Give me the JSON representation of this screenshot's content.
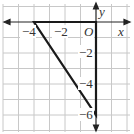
{
  "diagram": {
    "type": "coordinate-plane-triangle",
    "origin_label": "O",
    "x_axis_label": "x",
    "y_axis_label": "y",
    "x_tick_labels": [
      "−4",
      "−2"
    ],
    "y_tick_labels": [
      "−2",
      "−4",
      "−6"
    ],
    "grid": {
      "x_range": [
        -6,
        2
      ],
      "y_range": [
        -7,
        1
      ],
      "step": 1
    },
    "triangle": {
      "vertices": [
        {
          "x": -4,
          "y": 0
        },
        {
          "x": 0,
          "y": 0
        },
        {
          "x": 0,
          "y": -6
        }
      ]
    },
    "colors": {
      "grid": "#c8c8c8",
      "axis": "#222222",
      "triangle": "#1a1a1a",
      "background": "#ffffff"
    }
  }
}
